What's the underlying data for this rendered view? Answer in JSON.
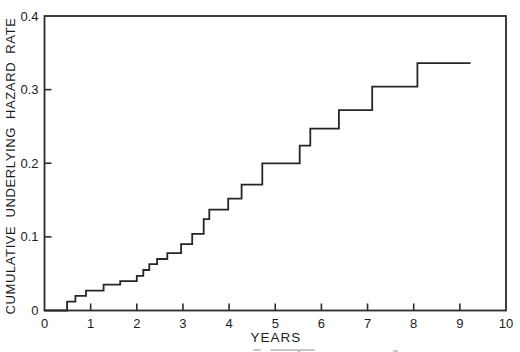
{
  "chart_data": {
    "type": "line",
    "style": "step",
    "title": "",
    "xlabel": "YEARS",
    "ylabel": "CUMULATIVE UNDERLYING HAZARD RATE",
    "xlim": [
      0,
      10
    ],
    "ylim": [
      0,
      0.4
    ],
    "xticks": [
      0,
      1,
      2,
      3,
      4,
      5,
      6,
      7,
      8,
      9,
      10
    ],
    "yticks": [
      0,
      0.1,
      0.2,
      0.3,
      0.4
    ],
    "ytick_labels": [
      "0",
      "0.1",
      "0.2",
      "0.3",
      "0.4"
    ],
    "grid": false,
    "legend": false,
    "line_color": "#262626",
    "axis_color": "#2a2a2a",
    "series": [
      {
        "name": "cumulative underlying hazard rate",
        "start": [
          0,
          0
        ],
        "steps": [
          [
            0.49,
            0.012
          ],
          [
            0.67,
            0.02
          ],
          [
            0.9,
            0.027
          ],
          [
            1.28,
            0.035
          ],
          [
            1.64,
            0.04
          ],
          [
            2.0,
            0.047
          ],
          [
            2.14,
            0.055
          ],
          [
            2.27,
            0.063
          ],
          [
            2.44,
            0.07
          ],
          [
            2.66,
            0.078
          ],
          [
            2.96,
            0.09
          ],
          [
            3.2,
            0.104
          ],
          [
            3.45,
            0.124
          ],
          [
            3.57,
            0.137
          ],
          [
            3.98,
            0.152
          ],
          [
            4.27,
            0.171
          ],
          [
            4.72,
            0.2
          ],
          [
            5.53,
            0.224
          ],
          [
            5.76,
            0.247
          ],
          [
            6.38,
            0.272
          ],
          [
            7.1,
            0.304
          ],
          [
            8.08,
            0.336
          ]
        ],
        "end_x": 9.23
      }
    ]
  }
}
